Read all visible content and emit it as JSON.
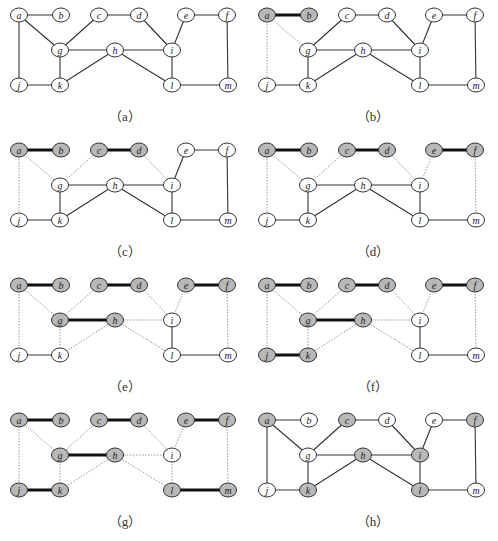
{
  "figure": {
    "node_positions": {
      "a": [
        19,
        15
      ],
      "b": [
        61,
        15
      ],
      "c": [
        99,
        15
      ],
      "d": [
        139,
        15
      ],
      "e": [
        186,
        15
      ],
      "f": [
        227,
        15
      ],
      "g": [
        60,
        50
      ],
      "h": [
        115,
        50
      ],
      "i": [
        172,
        50
      ],
      "j": [
        19,
        85
      ],
      "k": [
        60,
        85
      ],
      "l": [
        172,
        85
      ],
      "m": [
        228,
        85
      ]
    },
    "edges": [
      [
        "a",
        "b"
      ],
      [
        "a",
        "g"
      ],
      [
        "a",
        "j"
      ],
      [
        "c",
        "d"
      ],
      [
        "c",
        "g"
      ],
      [
        "d",
        "i"
      ],
      [
        "e",
        "f"
      ],
      [
        "e",
        "i"
      ],
      [
        "f",
        "m"
      ],
      [
        "g",
        "h"
      ],
      [
        "g",
        "k"
      ],
      [
        "h",
        "i"
      ],
      [
        "h",
        "k"
      ],
      [
        "h",
        "l"
      ],
      [
        "i",
        "l"
      ],
      [
        "j",
        "k"
      ],
      [
        "l",
        "m"
      ]
    ],
    "colors": {
      "gray_fill": "#b8b8b8",
      "white_fill": "#ffffff",
      "stroke": "#333333",
      "thick": "#111111",
      "dotted": "#999999"
    },
    "panels": [
      {
        "label": "（a）",
        "gray": [],
        "thick": [],
        "dotted": []
      },
      {
        "label": "（b）",
        "gray": [
          "a",
          "b"
        ],
        "thick": [
          [
            "a",
            "b"
          ]
        ],
        "dotted": [
          [
            "a",
            "g"
          ],
          [
            "a",
            "j"
          ]
        ]
      },
      {
        "label": "（c）",
        "gray": [
          "a",
          "b",
          "c",
          "d"
        ],
        "thick": [
          [
            "a",
            "b"
          ],
          [
            "c",
            "d"
          ]
        ],
        "dotted": [
          [
            "a",
            "g"
          ],
          [
            "a",
            "j"
          ],
          [
            "c",
            "g"
          ],
          [
            "d",
            "i"
          ]
        ]
      },
      {
        "label": "（d）",
        "gray": [
          "a",
          "b",
          "c",
          "d",
          "e",
          "f"
        ],
        "thick": [
          [
            "a",
            "b"
          ],
          [
            "c",
            "d"
          ],
          [
            "e",
            "f"
          ]
        ],
        "dotted": [
          [
            "a",
            "g"
          ],
          [
            "a",
            "j"
          ],
          [
            "c",
            "g"
          ],
          [
            "d",
            "i"
          ],
          [
            "e",
            "i"
          ],
          [
            "f",
            "m"
          ]
        ]
      },
      {
        "label": "（e）",
        "gray": [
          "a",
          "b",
          "c",
          "d",
          "e",
          "f",
          "g",
          "h"
        ],
        "thick": [
          [
            "a",
            "b"
          ],
          [
            "c",
            "d"
          ],
          [
            "e",
            "f"
          ],
          [
            "g",
            "h"
          ]
        ],
        "dotted": [
          [
            "a",
            "g"
          ],
          [
            "a",
            "j"
          ],
          [
            "c",
            "g"
          ],
          [
            "d",
            "i"
          ],
          [
            "e",
            "i"
          ],
          [
            "f",
            "m"
          ],
          [
            "g",
            "k"
          ],
          [
            "h",
            "i"
          ],
          [
            "h",
            "k"
          ],
          [
            "h",
            "l"
          ]
        ]
      },
      {
        "label": "（f）",
        "gray": [
          "a",
          "b",
          "c",
          "d",
          "e",
          "f",
          "g",
          "h",
          "j",
          "k"
        ],
        "thick": [
          [
            "a",
            "b"
          ],
          [
            "c",
            "d"
          ],
          [
            "e",
            "f"
          ],
          [
            "g",
            "h"
          ],
          [
            "j",
            "k"
          ]
        ],
        "dotted": [
          [
            "a",
            "g"
          ],
          [
            "a",
            "j"
          ],
          [
            "c",
            "g"
          ],
          [
            "d",
            "i"
          ],
          [
            "e",
            "i"
          ],
          [
            "f",
            "m"
          ],
          [
            "g",
            "k"
          ],
          [
            "h",
            "i"
          ],
          [
            "h",
            "k"
          ],
          [
            "h",
            "l"
          ]
        ]
      },
      {
        "label": "（g）",
        "gray": [
          "a",
          "b",
          "c",
          "d",
          "e",
          "f",
          "g",
          "h",
          "j",
          "k",
          "l",
          "m"
        ],
        "thick": [
          [
            "a",
            "b"
          ],
          [
            "c",
            "d"
          ],
          [
            "e",
            "f"
          ],
          [
            "g",
            "h"
          ],
          [
            "j",
            "k"
          ],
          [
            "l",
            "m"
          ]
        ],
        "dotted": [
          [
            "a",
            "g"
          ],
          [
            "a",
            "j"
          ],
          [
            "c",
            "g"
          ],
          [
            "d",
            "i"
          ],
          [
            "e",
            "i"
          ],
          [
            "f",
            "m"
          ],
          [
            "g",
            "k"
          ],
          [
            "h",
            "i"
          ],
          [
            "h",
            "k"
          ],
          [
            "h",
            "l"
          ],
          [
            "i",
            "l"
          ]
        ]
      },
      {
        "label": "（h）",
        "gray": [
          "a",
          "c",
          "f",
          "h",
          "i",
          "k",
          "l"
        ],
        "thick": [],
        "dotted": []
      }
    ]
  }
}
